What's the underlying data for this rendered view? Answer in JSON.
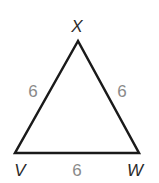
{
  "diagram": {
    "type": "equilateral-triangle",
    "vertices": [
      {
        "name": "X",
        "x": 78,
        "y": 41,
        "label_x": 77,
        "label_y": 32
      },
      {
        "name": "V",
        "x": 15,
        "y": 153,
        "label_x": 20,
        "label_y": 176
      },
      {
        "name": "W",
        "x": 139,
        "y": 153,
        "label_x": 135,
        "label_y": 176
      }
    ],
    "sides": [
      {
        "between": "XV",
        "length": "6",
        "label_x": 33,
        "label_y": 97
      },
      {
        "between": "XW",
        "length": "6",
        "label_x": 122,
        "label_y": 97
      },
      {
        "between": "VW",
        "length": "6",
        "label_x": 77,
        "label_y": 176
      }
    ],
    "stroke_color": "#1a1a1a",
    "side_label_color": "#8a8a8a"
  }
}
